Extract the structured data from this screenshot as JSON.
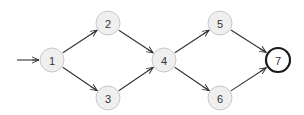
{
  "diagram": {
    "type": "directed-graph",
    "colors": {
      "node_fill": "#efefef",
      "node_stroke": "#c8c8c8",
      "final_stroke": "#1a1a1a",
      "edge": "#333333",
      "label": "#333333"
    },
    "start_arrow": {
      "from": [
        17,
        60
      ],
      "to": "1"
    },
    "nodes": [
      {
        "id": "1",
        "label": "1",
        "x": 52,
        "y": 60,
        "final": false
      },
      {
        "id": "2",
        "label": "2",
        "x": 108,
        "y": 23,
        "final": false
      },
      {
        "id": "3",
        "label": "3",
        "x": 108,
        "y": 98,
        "final": false
      },
      {
        "id": "4",
        "label": "4",
        "x": 164,
        "y": 60,
        "final": false
      },
      {
        "id": "5",
        "label": "5",
        "x": 220,
        "y": 23,
        "final": false
      },
      {
        "id": "6",
        "label": "6",
        "x": 220,
        "y": 98,
        "final": false
      },
      {
        "id": "7",
        "label": "7",
        "x": 278,
        "y": 60,
        "final": true
      }
    ],
    "edges": [
      {
        "from": "1",
        "to": "2"
      },
      {
        "from": "1",
        "to": "3"
      },
      {
        "from": "2",
        "to": "4"
      },
      {
        "from": "3",
        "to": "4"
      },
      {
        "from": "4",
        "to": "5"
      },
      {
        "from": "4",
        "to": "6"
      },
      {
        "from": "5",
        "to": "7"
      },
      {
        "from": "6",
        "to": "7"
      }
    ]
  }
}
